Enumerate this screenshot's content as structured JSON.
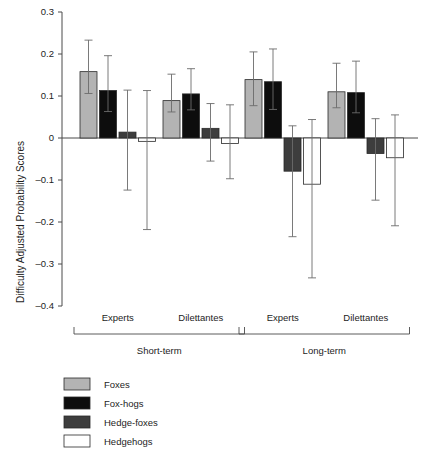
{
  "chart_data": {
    "type": "bar",
    "title": "",
    "subtitle": "",
    "xlabel": "",
    "ylabel": "Difficulty Adjusted Probability Scores",
    "ylim": [
      -0.4,
      0.3
    ],
    "grid": false,
    "legend_position": "bottom-left",
    "y_ticks": [
      "0.3",
      "0.2",
      "0.1",
      "0",
      "–0.1",
      "–0.2",
      "–0.3",
      "–0.4"
    ],
    "y_tick_values": [
      0.3,
      0.2,
      0.1,
      0,
      -0.1,
      -0.2,
      -0.3,
      -0.4
    ],
    "categories": [
      "Experts",
      "Dilettantes",
      "Experts",
      "Dilettantes"
    ],
    "supergroups": [
      {
        "label": "Short-term",
        "categories": [
          "Experts",
          "Dilettantes"
        ]
      },
      {
        "label": "Long-term",
        "categories": [
          "Experts",
          "Dilettantes"
        ]
      }
    ],
    "series": [
      {
        "name": "Foxes",
        "color": "#b3b3b3",
        "values": [
          0.158,
          0.089,
          0.139,
          0.11
        ],
        "err_low": [
          0.106,
          0.062,
          0.077,
          0.072
        ],
        "err_high": [
          0.233,
          0.152,
          0.205,
          0.178
        ]
      },
      {
        "name": "Fox-hogs",
        "color": "#0d0d0d",
        "values": [
          0.113,
          0.105,
          0.134,
          0.108
        ],
        "err_low": [
          0.063,
          0.067,
          0.068,
          0.06
        ],
        "err_high": [
          0.196,
          0.165,
          0.212,
          0.183
        ]
      },
      {
        "name": "Hedge-foxes",
        "color": "#3d3d3d",
        "values": [
          0.014,
          0.023,
          -0.079,
          -0.037
        ],
        "err_low": [
          -0.124,
          -0.055,
          -0.235,
          -0.148
        ],
        "err_high": [
          0.114,
          0.082,
          0.029,
          0.046
        ]
      },
      {
        "name": "Hedgehogs",
        "color": "#ffffff",
        "values": [
          -0.008,
          -0.013,
          -0.11,
          -0.047
        ],
        "err_low": [
          -0.218,
          -0.097,
          -0.333,
          -0.209
        ],
        "err_high": [
          0.113,
          0.079,
          0.044,
          0.055
        ]
      }
    ]
  },
  "legend": {
    "items": [
      {
        "label": "Foxes",
        "swatch": "#b3b3b3"
      },
      {
        "label": "Fox-hogs",
        "swatch": "#0d0d0d"
      },
      {
        "label": "Hedge-foxes",
        "swatch": "#3d3d3d"
      },
      {
        "label": "Hedgehogs",
        "swatch": "#ffffff"
      }
    ]
  },
  "axis": {
    "y_title": "Difficulty Adjusted Probability Scores"
  },
  "labels": {
    "cat_0": "Experts",
    "cat_1": "Dilettantes",
    "cat_2": "Experts",
    "cat_3": "Dilettantes",
    "grp_0": "Short-term",
    "grp_1": "Long-term",
    "tick_0": "0.3",
    "tick_1": "0.2",
    "tick_2": "0.1",
    "tick_3": "0",
    "tick_4": "–0.1",
    "tick_5": "–0.2",
    "tick_6": "–0.3",
    "tick_7": "–0.4"
  }
}
